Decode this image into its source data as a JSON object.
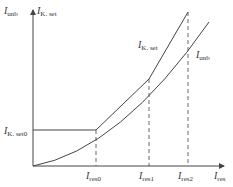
{
  "axes": {
    "y_label_main": "I",
    "y_label_main_sub": "unb",
    "y_label_second": "I",
    "y_label_second_sub": "K. set",
    "x_label": "I",
    "x_label_sub": "res"
  },
  "curves": {
    "k_set": {
      "label": "I",
      "sub": "K. set"
    },
    "unb": {
      "label": "I",
      "sub": "unb"
    }
  },
  "y_marker": {
    "label": "I",
    "sub": "K. set0"
  },
  "x_markers": [
    {
      "label": "I",
      "sub": "res0"
    },
    {
      "label": "I",
      "sub": "res1"
    },
    {
      "label": "I",
      "sub": "res2"
    }
  ],
  "colors": {
    "line": "#444444",
    "background": "#ffffff"
  }
}
